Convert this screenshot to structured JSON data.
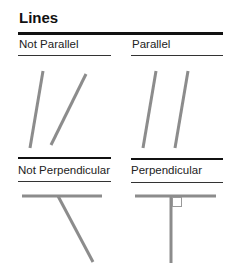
{
  "title": "Lines",
  "panels": [
    {
      "label": "Not Parallel",
      "kind": "not-parallel"
    },
    {
      "label": "Parallel",
      "kind": "parallel"
    },
    {
      "label": "Not Perpendicular",
      "kind": "not-perpendicular"
    },
    {
      "label": "Perpendicular",
      "kind": "perpendicular"
    }
  ],
  "colors": {
    "line": "#8c8c8c",
    "rule": "#111111",
    "right_angle_marker": "#999999"
  }
}
